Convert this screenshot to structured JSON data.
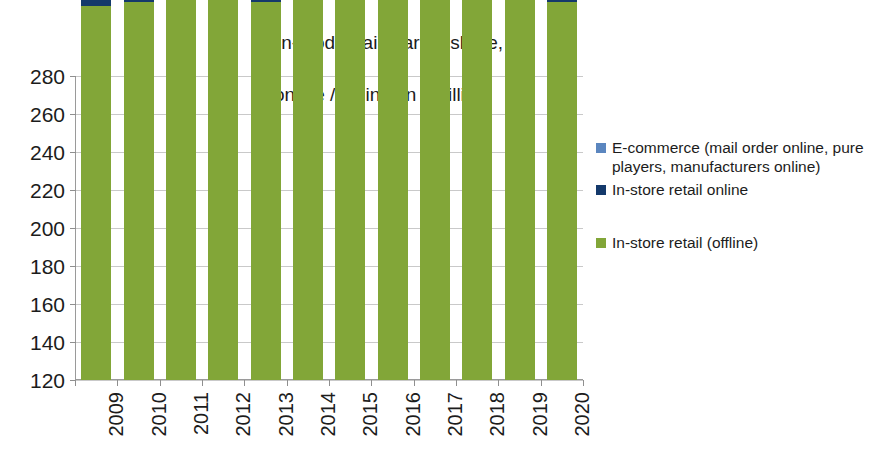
{
  "chart_data": {
    "type": "bar",
    "stacked": true,
    "title": "Non-food retail market share,\nonline / offline, in € billion",
    "title_line1": "Non-food retail market share,",
    "title_line2": "online / offline, in € billion",
    "xlabel": "",
    "ylabel": "",
    "ylim": [
      120,
      280
    ],
    "ystep": 20,
    "grid": true,
    "legend_position": "right",
    "categories": [
      "2009",
      "2010",
      "2011",
      "2012",
      "2013",
      "2014",
      "2015",
      "2016",
      "2017",
      "2018",
      "2019",
      "2020"
    ],
    "ytick_labels": [
      "280",
      "260",
      "240",
      "220",
      "200",
      "180",
      "160",
      "140",
      "120"
    ],
    "series": [
      {
        "name": "In-store retail (offline)",
        "color": "#82a638",
        "values": [
          197,
          199,
          201,
          204,
          199,
          206,
          206,
          205,
          204,
          203,
          202,
          199
        ]
      },
      {
        "name": "In-store retail online",
        "color": "#14396b",
        "values": [
          3,
          4,
          7,
          6,
          12,
          10,
          12,
          14,
          16,
          17,
          18,
          21
        ]
      },
      {
        "name": "E-commerce (mail order online, pure players, manufacturers online)",
        "color": "#5b86bf",
        "values": [
          13,
          18,
          19,
          24,
          25,
          28,
          30,
          33,
          35,
          37,
          40,
          42
        ]
      }
    ],
    "totals": [
      213,
      221,
      227,
      234,
      236,
      244,
      248,
      252,
      255,
      257,
      260,
      262
    ]
  },
  "legend": {
    "items": [
      {
        "label": "E-commerce (mail order online, pure players, manufacturers online)",
        "color": "#5b86bf",
        "name": "legend-item-ecommerce"
      },
      {
        "label": "In-store retail online",
        "color": "#14396b",
        "name": "legend-item-instore-online"
      },
      {
        "label": "In-store retail (offline)",
        "color": "#82a638",
        "name": "legend-item-instore-offline"
      }
    ]
  },
  "colors": {
    "ecommerce": "#5b86bf",
    "instore_online": "#14396b",
    "instore_offline": "#82a638",
    "gridline": "#c9c9c9",
    "axis": "#9a9a9a",
    "text": "#1c1c1c",
    "background": "#ffffff"
  }
}
